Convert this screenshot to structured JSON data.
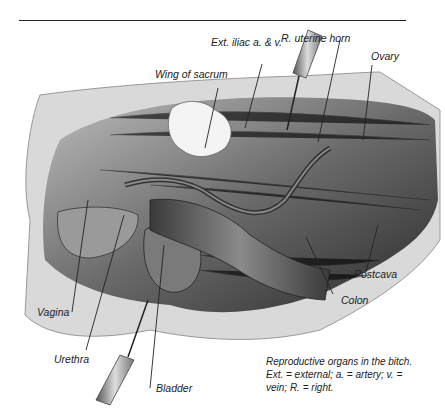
{
  "figure": {
    "labels": {
      "ext_iliac": "Ext. iliac a. & v.",
      "r_uterine_horn": "R. uterine horn",
      "ovary": "Ovary",
      "wing_of_sacrum": "Wing of sacrum",
      "postcava": "Postcava",
      "colon": "Colon",
      "vagina": "Vagina",
      "urethra": "Urethra",
      "bladder": "Bladder"
    },
    "caption": {
      "line1": "Reproductive organs in the bitch.",
      "line2": "Ext. = external; a. = artery; v. =",
      "line3": "vein; R. = right."
    }
  }
}
